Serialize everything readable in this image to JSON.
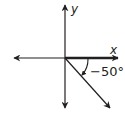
{
  "diagram": {
    "type": "coordinate-plane-angle",
    "x_axis_label": "x",
    "y_axis_label": "y",
    "angle_label": "−50°",
    "angle_degrees": -50,
    "initial_side": "positive x-axis",
    "rotation_direction": "clockwise",
    "colors": {
      "line": "#231f20",
      "background": "#ffffff"
    }
  }
}
